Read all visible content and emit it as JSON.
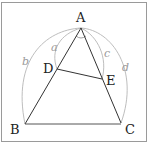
{
  "diagram": {
    "points": {
      "A": {
        "label": "A",
        "x": 81,
        "y": 28
      },
      "B": {
        "label": "B",
        "x": 25,
        "y": 124
      },
      "C": {
        "label": "C",
        "x": 121,
        "y": 123
      },
      "D": {
        "label": "D",
        "x": 57,
        "y": 69
      },
      "E": {
        "label": "E",
        "x": 102,
        "y": 79
      }
    },
    "arc_labels": {
      "a": "a",
      "b": "b",
      "c": "c",
      "d": "d"
    },
    "colors": {
      "segment": "#333333",
      "arc": "#b0b0b0",
      "frame": "#9a9a9a"
    }
  }
}
